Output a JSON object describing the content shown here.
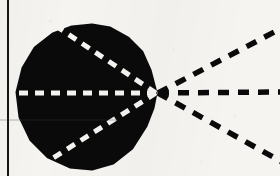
{
  "figure": {
    "kind": "scanned-line-figure",
    "caption": "",
    "width": 280,
    "height": 176,
    "background_color": "#f6f4f1",
    "ink_color": "#0a0a0a",
    "highlight_color": "#f6f4f1"
  },
  "page_rule": {
    "label": "vertical-page-rule",
    "orientation": "vertical",
    "x": 8,
    "y_start": 0,
    "y_end": 176,
    "thickness": 2.0,
    "color": "#141414"
  },
  "blob": {
    "label": "black-teardrop-region",
    "fill_color": "#0a0a0a",
    "apex": {
      "x": 156,
      "y": 93
    },
    "center": {
      "x": 84,
      "y": 96
    },
    "radius_x": 68,
    "radius_y": 72,
    "top_y": 26,
    "bottom_y": 170,
    "left_x": 17,
    "right_x": 158,
    "outline_points": "156,93 150,70 142,52 128,38 110,28 92,25 72,27 53,34 35,48 23,68 17,92 20,117 31,140 48,157 70,167 92,169 113,163 132,148 146,126 153,108"
  },
  "inner_rays": {
    "label": "white-dashed-rays-inside-blob",
    "color": "#f6f4f1",
    "stroke_width": 5.0,
    "dash_pattern": "9 7",
    "origin": {
      "x": 156,
      "y": 93
    },
    "items": [
      {
        "name": "inner-ray-upper",
        "angle_label": "upper",
        "end": {
          "x": 50,
          "y": 22
        }
      },
      {
        "name": "inner-ray-horizontal",
        "angle_label": "horizontal",
        "end": {
          "x": 19,
          "y": 93
        }
      },
      {
        "name": "inner-ray-lower",
        "angle_label": "lower",
        "end": {
          "x": 53,
          "y": 158
        }
      }
    ]
  },
  "outer_rays": {
    "label": "black-dashed-rays-outside-blob",
    "color": "#0a0a0a",
    "stroke_width": 5.5,
    "dash_pattern": "11 9",
    "origin": {
      "x": 158,
      "y": 93
    },
    "items": [
      {
        "name": "outer-ray-upper",
        "angle_label": "upper",
        "end": {
          "x": 282,
          "y": 28
        }
      },
      {
        "name": "outer-ray-horizontal",
        "angle_label": "horizontal",
        "end": {
          "x": 282,
          "y": 92
        }
      },
      {
        "name": "outer-ray-lower",
        "angle_label": "lower",
        "end": {
          "x": 282,
          "y": 162
        }
      }
    ]
  },
  "scan_artifacts": {
    "label": "scan-streak",
    "streak_y": 120,
    "streak_x_start": 0,
    "streak_x_end": 118,
    "streak_opacity": 0.35
  }
}
